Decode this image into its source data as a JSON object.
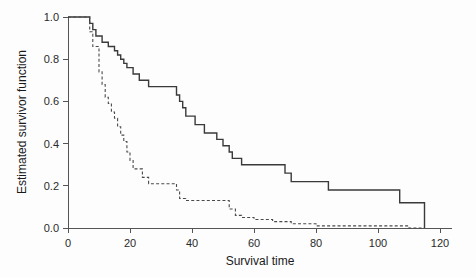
{
  "figure": {
    "background_color": "#fdfdfd",
    "plot_area": {
      "left": 68,
      "right": 440,
      "top": 17,
      "bottom": 228
    }
  },
  "chart_data": {
    "type": "line",
    "subtype": "kaplan-meier-step",
    "title": "",
    "xlabel": "Survival time",
    "ylabel": "Estimated survivor function",
    "xlim": [
      0,
      120
    ],
    "ylim": [
      0.0,
      1.0
    ],
    "xticks": [
      0,
      20,
      40,
      60,
      80,
      100,
      120
    ],
    "xticklabels": [
      "0",
      "20",
      "40",
      "60",
      "80",
      "100",
      "120"
    ],
    "yticks": [
      0.0,
      0.2,
      0.4,
      0.6,
      0.8,
      1.0
    ],
    "yticklabels": [
      "0.0",
      "0.2",
      "0.4",
      "0.6",
      "0.8",
      "1.0"
    ],
    "grid": false,
    "legend": "none",
    "series": [
      {
        "name": "solid-curve",
        "linestyle": "solid",
        "color": "#3a3a3a",
        "x": [
          0,
          6,
          7,
          8,
          9,
          11,
          13,
          15,
          16,
          17,
          18,
          19,
          21,
          23,
          26,
          29,
          32,
          35,
          36,
          37,
          38,
          41,
          44,
          47,
          48,
          50,
          52,
          53,
          56,
          62,
          68,
          70,
          72,
          78,
          84,
          90,
          100,
          107,
          115
        ],
        "y": [
          1.0,
          1.0,
          0.97,
          0.94,
          0.91,
          0.88,
          0.86,
          0.84,
          0.82,
          0.8,
          0.78,
          0.76,
          0.73,
          0.7,
          0.67,
          0.67,
          0.67,
          0.63,
          0.6,
          0.57,
          0.53,
          0.49,
          0.45,
          0.45,
          0.42,
          0.39,
          0.36,
          0.33,
          0.3,
          0.3,
          0.3,
          0.26,
          0.22,
          0.22,
          0.18,
          0.18,
          0.18,
          0.12,
          0.0
        ]
      },
      {
        "name": "dashed-curve",
        "linestyle": "dashed",
        "color": "#4a4a4a",
        "x": [
          0,
          6,
          7,
          8,
          9,
          10,
          11,
          12,
          13,
          14,
          15,
          16,
          17,
          18,
          19,
          20,
          21,
          24,
          26,
          29,
          32,
          35,
          36,
          38,
          40,
          43,
          46,
          48,
          50,
          52,
          54,
          56,
          60,
          66,
          72,
          80,
          90,
          100,
          110,
          115
        ],
        "y": [
          1.0,
          1.0,
          0.93,
          0.86,
          0.86,
          0.74,
          0.68,
          0.62,
          0.59,
          0.55,
          0.52,
          0.48,
          0.44,
          0.41,
          0.36,
          0.32,
          0.28,
          0.24,
          0.21,
          0.21,
          0.21,
          0.18,
          0.14,
          0.13,
          0.13,
          0.13,
          0.13,
          0.13,
          0.13,
          0.09,
          0.06,
          0.05,
          0.04,
          0.03,
          0.02,
          0.01,
          0.01,
          0.01,
          0.0,
          0.0
        ]
      }
    ]
  }
}
